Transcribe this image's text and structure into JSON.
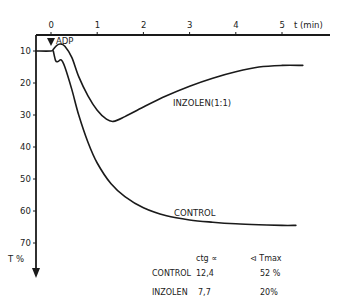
{
  "chart_data": {
    "type": "line",
    "title": "",
    "xlabel": "t (min)",
    "ylabel": "T %",
    "xlim": [
      0,
      5.5
    ],
    "ylim": [
      5,
      75
    ],
    "y_inverted": true,
    "x_ticks": [
      "0",
      "1",
      "2",
      "3",
      "4",
      "5"
    ],
    "y_ticks": [
      "10",
      "20",
      "30",
      "40",
      "50",
      "60",
      "70"
    ],
    "grid": false,
    "annotations": [
      {
        "text": "ADP",
        "x": 0,
        "marker": "down-arrow"
      }
    ],
    "series": [
      {
        "name": "INZOLEN(1:1)",
        "x": [
          -0.8,
          0.0,
          0.05,
          0.12,
          0.2,
          0.3,
          0.45,
          0.6,
          0.8,
          1.0,
          1.2,
          1.35,
          1.6,
          2.0,
          2.5,
          3.0,
          3.5,
          4.0,
          4.5,
          5.0,
          5.45
        ],
        "y": [
          10,
          10,
          9.5,
          8.3,
          7.8,
          8.5,
          12,
          18,
          24,
          28.5,
          31.3,
          32,
          30.5,
          27.5,
          24,
          21,
          18.5,
          16.5,
          15,
          14.5,
          14.5
        ]
      },
      {
        "name": "CONTROL",
        "x": [
          0.05,
          0.1,
          0.15,
          0.22,
          0.3,
          0.45,
          0.6,
          0.8,
          1.0,
          1.3,
          1.6,
          2.0,
          2.5,
          3.0,
          3.5,
          4.0,
          4.5,
          5.0,
          5.3
        ],
        "y": [
          10,
          13,
          13.3,
          12.8,
          15,
          22,
          30,
          38.5,
          45,
          51.5,
          55.5,
          59,
          61.5,
          62.8,
          63.5,
          64,
          64.3,
          64.5,
          64.5
        ]
      }
    ],
    "table": {
      "headers": [
        "",
        "ctg ∝",
        "⊲ Tmax"
      ],
      "rows": [
        [
          "CONTROL",
          "12,4",
          "52 %"
        ],
        [
          "INZOLEN",
          "7,7",
          "20%"
        ]
      ]
    }
  }
}
